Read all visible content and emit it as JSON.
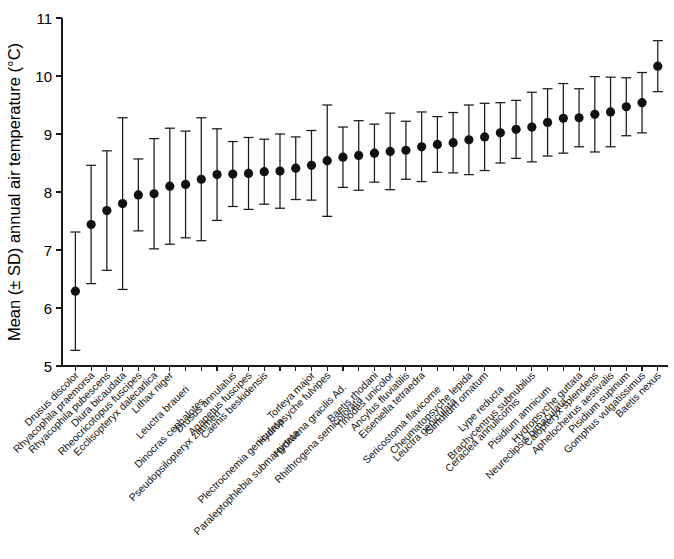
{
  "chart_data": {
    "type": "scatter",
    "title": "",
    "subtitle": "",
    "xlabel": "",
    "ylabel": "Mean (± SD) annual air temperature (°C)",
    "ylim": [
      5,
      11
    ],
    "yticks": [
      5,
      6,
      7,
      8,
      9,
      10,
      11
    ],
    "ytick_labels": [
      "5",
      "6",
      "7",
      "8",
      "9",
      "10",
      "11"
    ],
    "grid": false,
    "legend": false,
    "legend_position": "none",
    "error_type": "SD",
    "marker": "filled-circle",
    "marker_color": "#111111",
    "errorbar_color": "#1a1a1a",
    "categories": [
      "Drusus discolor",
      "Rhyacophila praemorsa",
      "Rhyacophila pubescens",
      "Diura bicaudata",
      "Rheocricotopus fuscipes",
      "Ecclisopteryx dalecarlica",
      "Lithax niger",
      "Leuctra braueri",
      "Dinocras cephalotes",
      "Pseudopsilopteryx zimmeri",
      "Drusus annulatus",
      "Agapetus fuscipes",
      "Caenis beskidensis",
      "Plectrocnemia geniculata",
      "Paraleptophlebia submarginata",
      "Torleya major",
      "Hydropsyche fulvipes",
      "Hydraena gracilis Ad.",
      "Rhithrogena semicolorata",
      "Baetis rhodani",
      "Tinodes unicolor",
      "Ancylus fluviatilis",
      "Eiseniella tetraedra",
      "Sericostoma flavicorne",
      "Leuctra geniculata",
      "Cheumatopsyche lepida",
      "Simulium ornatum",
      "Lype reducta",
      "Ceraclea annulicornis",
      "Brachycentrus subnubilus",
      "Pisidium amnicum",
      "Neureclipsis bimaculata",
      "Hydropsyche guttata",
      "Calopteryx splendens",
      "Aphelocheirus aestivalis",
      "Pisidium supinum",
      "Gomphus vulgatissimus",
      "Baetis nexus"
    ],
    "values": [
      6.29,
      7.44,
      7.68,
      7.8,
      7.95,
      7.97,
      8.1,
      8.13,
      8.22,
      8.3,
      8.31,
      8.32,
      8.35,
      8.36,
      8.41,
      8.46,
      8.54,
      8.6,
      8.63,
      8.67,
      8.7,
      8.72,
      8.78,
      8.82,
      8.85,
      8.9,
      8.95,
      9.02,
      9.08,
      9.12,
      9.2,
      9.27,
      9.28,
      9.34,
      9.38,
      9.47,
      9.54,
      10.17
    ],
    "errors": [
      1.02,
      1.02,
      1.03,
      1.48,
      0.62,
      0.95,
      1.0,
      0.92,
      1.06,
      0.79,
      0.56,
      0.62,
      0.56,
      0.64,
      0.54,
      0.6,
      0.96,
      0.52,
      0.6,
      0.5,
      0.66,
      0.5,
      0.6,
      0.48,
      0.52,
      0.6,
      0.58,
      0.52,
      0.5,
      0.6,
      0.58,
      0.6,
      0.5,
      0.65,
      0.6,
      0.5,
      0.52,
      0.44
    ],
    "axis_ticks_count": 38
  },
  "accessibility": {
    "figure_description": "Dot-and-whisker plot of mean annual air temperature per aquatic invertebrate species, sorted ascending."
  }
}
